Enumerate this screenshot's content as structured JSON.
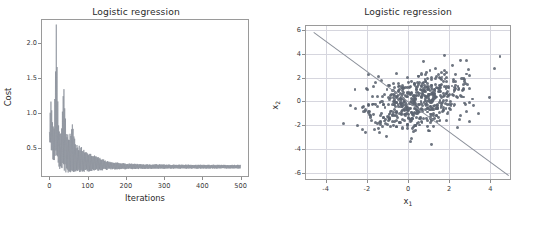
{
  "figure": {
    "width": 544,
    "height": 228,
    "background": "#ffffff",
    "line_color": "#8a8f99",
    "point_color": "#5b6370",
    "grid_color": "#d6d6de",
    "spine_color": "#9a9a9a"
  },
  "panels": [
    {
      "name": "cost-convergence",
      "title": "Logistic regression",
      "xlabel": "Iterations",
      "ylabel": "Cost"
    },
    {
      "name": "decision-boundary",
      "title": "Logistic regression",
      "xlabel_main": "x",
      "xlabel_sub": "1",
      "ylabel_main": "x",
      "ylabel_sub": "2"
    }
  ],
  "chart_data": [
    {
      "type": "line",
      "title": "Logistic regression",
      "xlabel": "Iterations",
      "ylabel": "Cost",
      "xlim": [
        -22,
        522
      ],
      "ylim": [
        0.08,
        2.34
      ],
      "xticks": [
        0,
        100,
        200,
        300,
        400,
        500
      ],
      "xticklabels": [
        "0",
        "100",
        "200",
        "300",
        "400",
        "500"
      ],
      "yticks": [
        0.5,
        1.0,
        1.5,
        2.0
      ],
      "yticklabels": [
        "0.5",
        "1.0",
        "1.5",
        "2.0"
      ],
      "grid": false,
      "legend": null,
      "series": [
        {
          "name": "cost",
          "description": "Stochastic/mini-batch gradient descent cost per iteration: highly oscillatory early, decaying to a narrow oscillating band near 0.22 after ~150 iterations.",
          "envelope_upper": [
            {
              "x": 0,
              "y": 0.72
            },
            {
              "x": 3,
              "y": 1.24
            },
            {
              "x": 8,
              "y": 0.95
            },
            {
              "x": 12,
              "y": 0.8
            },
            {
              "x": 18,
              "y": 2.24
            },
            {
              "x": 24,
              "y": 0.86
            },
            {
              "x": 30,
              "y": 0.7
            },
            {
              "x": 38,
              "y": 1.39
            },
            {
              "x": 44,
              "y": 0.72
            },
            {
              "x": 52,
              "y": 0.62
            },
            {
              "x": 60,
              "y": 0.86
            },
            {
              "x": 68,
              "y": 0.55
            },
            {
              "x": 76,
              "y": 0.52
            },
            {
              "x": 84,
              "y": 0.5
            },
            {
              "x": 92,
              "y": 0.46
            },
            {
              "x": 100,
              "y": 0.44
            },
            {
              "x": 115,
              "y": 0.4
            },
            {
              "x": 130,
              "y": 0.36
            },
            {
              "x": 150,
              "y": 0.31
            },
            {
              "x": 175,
              "y": 0.29
            },
            {
              "x": 200,
              "y": 0.275
            },
            {
              "x": 250,
              "y": 0.265
            },
            {
              "x": 300,
              "y": 0.26
            },
            {
              "x": 350,
              "y": 0.258
            },
            {
              "x": 400,
              "y": 0.256
            },
            {
              "x": 450,
              "y": 0.255
            },
            {
              "x": 500,
              "y": 0.255
            }
          ],
          "envelope_lower": [
            {
              "x": 0,
              "y": 0.6
            },
            {
              "x": 10,
              "y": 0.3
            },
            {
              "x": 20,
              "y": 0.22
            },
            {
              "x": 30,
              "y": 0.17
            },
            {
              "x": 45,
              "y": 0.14
            },
            {
              "x": 60,
              "y": 0.13
            },
            {
              "x": 80,
              "y": 0.14
            },
            {
              "x": 100,
              "y": 0.15
            },
            {
              "x": 130,
              "y": 0.17
            },
            {
              "x": 160,
              "y": 0.185
            },
            {
              "x": 200,
              "y": 0.19
            },
            {
              "x": 250,
              "y": 0.195
            },
            {
              "x": 300,
              "y": 0.197
            },
            {
              "x": 350,
              "y": 0.198
            },
            {
              "x": 400,
              "y": 0.199
            },
            {
              "x": 450,
              "y": 0.2
            },
            {
              "x": 500,
              "y": 0.2
            }
          ],
          "converged_value": 0.22
        }
      ]
    },
    {
      "type": "scatter",
      "title": "Logistic regression",
      "xlabel": "x_1",
      "ylabel": "x_2",
      "xlim": [
        -5.0,
        5.0
      ],
      "ylim": [
        -6.6,
        6.4
      ],
      "xticks": [
        -4,
        -2,
        0,
        2,
        4
      ],
      "xticklabels": [
        "-4",
        "-2",
        "0",
        "2",
        "4"
      ],
      "yticks": [
        -6,
        -4,
        -2,
        0,
        2,
        4,
        6
      ],
      "yticklabels": [
        "-6",
        "-4",
        "-2",
        "0",
        "2",
        "4",
        "6"
      ],
      "grid": true,
      "legend": null,
      "n_points": 560,
      "cluster": {
        "center_x": 0.55,
        "center_y": 0.05,
        "spread_x": 1.25,
        "spread_y": 1.25,
        "marker_size": 3.0,
        "color": "#5b6370"
      },
      "decision_boundary": {
        "type": "line",
        "from": {
          "x": -4.55,
          "y": 5.85
        },
        "to": {
          "x": 4.9,
          "y": -6.15
        },
        "color": "#8a8f99"
      }
    }
  ]
}
